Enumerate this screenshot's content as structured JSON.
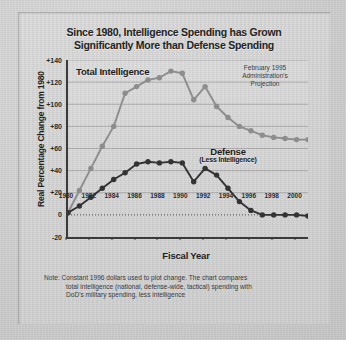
{
  "title": {
    "line1": "Since 1980, Intelligence Spending has Grown",
    "line2": "Significantly More than Defense Spending"
  },
  "annotation": {
    "line1": "February 1995",
    "line2": "Administration's",
    "line3": "Projection"
  },
  "series_labels": {
    "intelligence": "Total Intelligence",
    "defense_main": "Defense",
    "defense_sub": "(Less Intelligence)"
  },
  "note": {
    "label": "Note:",
    "line1": "Constant 1996 dollars used to plot change. The chart compares",
    "line2": "total intelligence (national, defense-wide, tactical) spending with",
    "line3": "DoD's military spending, less intelligence"
  },
  "colors": {
    "intelligence": "#8d8d8d",
    "defense": "#333333",
    "axis": "#3a3a3a",
    "grid": "#787878",
    "paper": "#d4d4d4",
    "text": "#242424"
  },
  "chart_data": {
    "type": "line",
    "title": "Since 1980, Intelligence Spending has Grown Significantly More than Defense Spending",
    "xlabel": "Fiscal Year",
    "ylabel": "Real Percentage Change from 1980",
    "xlim": [
      1980,
      2001
    ],
    "ylim": [
      -20,
      140
    ],
    "yticks": [
      "+140",
      "+120",
      "+100",
      "+80",
      "+60",
      "+40",
      "+20",
      "0",
      "-20"
    ],
    "ytick_values": [
      140,
      120,
      100,
      80,
      60,
      40,
      20,
      0,
      -20
    ],
    "xticks": [
      "1980",
      "1982",
      "1984",
      "1986",
      "1988",
      "1990",
      "1992",
      "1994",
      "1996",
      "1998",
      "2000"
    ],
    "xtick_values": [
      1980,
      1982,
      1984,
      1986,
      1988,
      1990,
      1992,
      1994,
      1996,
      1998,
      2000
    ],
    "grid": true,
    "legend": "inline-labels",
    "x": [
      1980,
      1981,
      1982,
      1983,
      1984,
      1985,
      1986,
      1987,
      1988,
      1989,
      1990,
      1991,
      1992,
      1993,
      1994,
      1995,
      1996,
      1997,
      1998,
      1999,
      2000,
      2001
    ],
    "series": [
      {
        "name": "Total Intelligence",
        "color": "#8d8d8d",
        "values": [
          2,
          22,
          42,
          62,
          80,
          110,
          116,
          122,
          124,
          130,
          128,
          104,
          116,
          98,
          88,
          80,
          76,
          72,
          70,
          69,
          68,
          68
        ]
      },
      {
        "name": "Defense (Less Intelligence)",
        "color": "#333333",
        "values": [
          2,
          8,
          16,
          24,
          32,
          38,
          46,
          48,
          47,
          48,
          47,
          30,
          42,
          36,
          24,
          12,
          4,
          0,
          0,
          0,
          0,
          -1
        ]
      }
    ],
    "annotations": [
      {
        "text": "February 1995 Administration's Projection",
        "position": "top-right"
      }
    ],
    "note": "Note: Constant 1996 dollars used to plot change. The chart compares total intelligence (national, defense-wide, tactical) spending with DoD's military spending, less intelligence"
  }
}
